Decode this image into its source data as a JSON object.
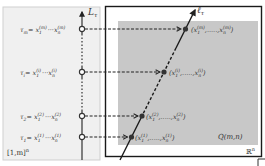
{
  "diagram": {
    "left_panel": {
      "label": "[1,m]",
      "label_sup": "n",
      "fill": "#f0f0f0",
      "border": "#cccccc"
    },
    "axis": {
      "label": "L",
      "label_sub": "τ",
      "points": [
        {
          "tau": "τ",
          "tau_sub": "m",
          "eq": "= x",
          "first_sub": "1",
          "first_sup": "(m)",
          "dots": "···",
          "last": "x",
          "last_sub": "n",
          "last_sup": "(m)",
          "y": 29
        },
        {
          "tau": "τ",
          "tau_sub": "i",
          "eq": "= x",
          "first_sub": "1",
          "first_sup": "(i)",
          "dots": "···",
          "last": "x",
          "last_sub": "n",
          "last_sup": "(i)",
          "y": 72
        },
        {
          "tau": "τ",
          "tau_sub": "2",
          "eq": "= x",
          "first_sub": "1",
          "first_sup": "(2)",
          "dots": "···",
          "last": "x",
          "last_sub": "n",
          "last_sup": "(2)",
          "y": 116
        },
        {
          "tau": "τ",
          "tau_sub": "1",
          "eq": "= x",
          "first_sub": "1",
          "first_sup": "(1)",
          "dots": "···",
          "last": "x",
          "last_sub": "n",
          "last_sup": "(1)",
          "y": 137
        }
      ]
    },
    "right_box": {
      "space_label": "ℝ",
      "space_sup": "n",
      "region_label": "Q(m,n)",
      "region_fill": "#c8c8c8",
      "line_label": "ℓ",
      "line_sub": "τ",
      "mapped_points": [
        {
          "open": "(x",
          "first_sub": "1",
          "first_sup": "(m)",
          "dots": ",.....,",
          "last": "x",
          "last_sub": "n",
          "last_sup": "(m)",
          "close": ")"
        },
        {
          "open": "(x",
          "first_sub": "1",
          "first_sup": "(i)",
          "dots": ",.....,",
          "last": "x",
          "last_sub": "n",
          "last_sup": "(i)",
          "close": ")"
        },
        {
          "open": "(x",
          "first_sub": "1",
          "first_sup": "(2)",
          "dots": ",.....,",
          "last": "x",
          "last_sub": "n",
          "last_sup": "(2)",
          "close": ")"
        },
        {
          "open": "(x",
          "first_sub": "1",
          "first_sup": "(1)",
          "dots": ",.....,",
          "last": "x",
          "last_sub": "n",
          "last_sup": "(1)",
          "close": ")"
        }
      ]
    }
  }
}
